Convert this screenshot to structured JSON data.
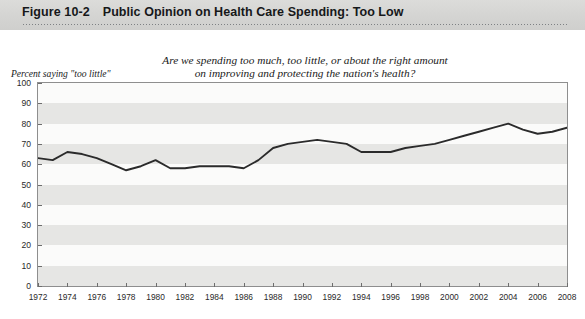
{
  "header": {
    "figure_number": "Figure 10-2",
    "title": "Public Opinion on Health Care Spending: Too Low"
  },
  "chart_data": {
    "type": "line",
    "title": "Public Opinion on Health Care Spending: Too Low",
    "subtitle_line1": "Are we spending too much, too little, or about the right amount",
    "subtitle_line2": "on improving and protecting the nation's health?",
    "ylabel": "Percent saying \"too little\"",
    "xlabel": "",
    "ylim": [
      0,
      100
    ],
    "ytick_step": 10,
    "yticks": [
      0,
      10,
      20,
      30,
      40,
      50,
      60,
      70,
      80,
      90,
      100
    ],
    "xlim": [
      1972,
      2008
    ],
    "xticks": [
      1972,
      1974,
      1976,
      1978,
      1980,
      1982,
      1984,
      1986,
      1988,
      1990,
      1992,
      1994,
      1996,
      1998,
      2000,
      2002,
      2004,
      2006,
      2008
    ],
    "grid": "horizontal-bands",
    "legend": "none",
    "line_color": "#2b2b2b",
    "x": [
      1972,
      1973,
      1974,
      1975,
      1976,
      1977,
      1978,
      1979,
      1980,
      1981,
      1982,
      1983,
      1984,
      1985,
      1986,
      1987,
      1988,
      1989,
      1990,
      1991,
      1992,
      1993,
      1994,
      1995,
      1996,
      1997,
      1998,
      1999,
      2000,
      2001,
      2002,
      2003,
      2004,
      2005,
      2006,
      2007,
      2008
    ],
    "values": [
      63,
      62,
      66,
      65,
      63,
      60,
      57,
      59,
      62,
      58,
      58,
      59,
      59,
      59,
      58,
      62,
      68,
      70,
      71,
      72,
      71,
      70,
      66,
      66,
      66,
      68,
      69,
      70,
      72,
      74,
      76,
      78,
      80,
      77,
      75,
      76,
      78
    ],
    "series": [
      {
        "name": "Percent saying \"too little\"",
        "values": [
          63,
          62,
          66,
          65,
          63,
          60,
          57,
          59,
          62,
          58,
          58,
          59,
          59,
          59,
          58,
          62,
          68,
          70,
          71,
          72,
          71,
          70,
          66,
          66,
          66,
          68,
          69,
          70,
          72,
          74,
          76,
          78,
          80,
          77,
          75,
          76,
          78
        ]
      }
    ]
  },
  "source_note": ""
}
